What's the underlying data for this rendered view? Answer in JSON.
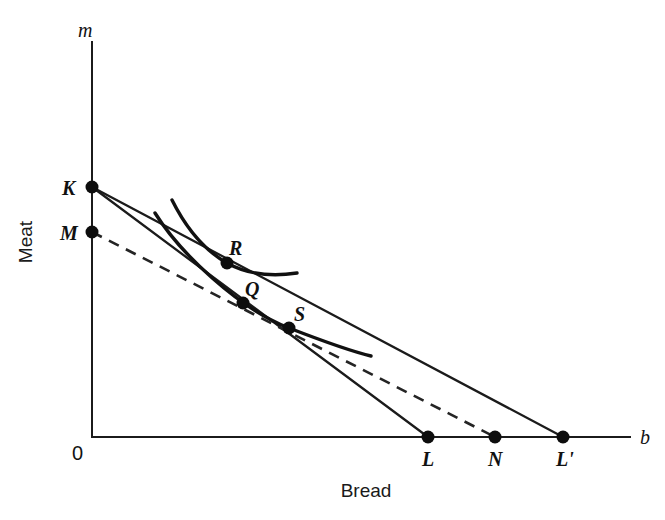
{
  "figure": {
    "background_color": "#ffffff",
    "ink_color": "#1a1a1a",
    "width": 665,
    "height": 520
  },
  "axes": {
    "y_axis_symbol": "m",
    "x_axis_symbol": "b",
    "y_axis_title": "Meat",
    "x_axis_title": "Bread",
    "origin_label": "0",
    "origin_px": {
      "x": 92,
      "y": 437
    },
    "y_axis_top_px": 42,
    "x_axis_right_px": 630
  },
  "points": {
    "K": {
      "label": "K",
      "x": 92,
      "y": 187,
      "label_x": 62,
      "label_y": 195,
      "desc": "vertical intercept of both solid budget lines"
    },
    "M": {
      "label": "M",
      "x": 92,
      "y": 232,
      "label_x": 60,
      "label_y": 240,
      "desc": "vertical intercept of dashed compensated budget line"
    },
    "R": {
      "label": "R",
      "x": 227,
      "y": 263,
      "label_x": 229,
      "label_y": 255,
      "desc": "tangency on higher indifference curve with line K-L-prime"
    },
    "Q": {
      "label": "Q",
      "x": 243,
      "y": 303,
      "label_x": 245,
      "label_y": 296,
      "desc": "tangency on lower indifference curve with dashed line M-N"
    },
    "S": {
      "label": "S",
      "x": 289,
      "y": 328,
      "label_x": 294,
      "label_y": 321,
      "desc": "tangency on lower indifference curve with line K-L"
    },
    "L": {
      "label": "L",
      "x": 428,
      "y": 437,
      "label_x": 422,
      "label_y": 466,
      "desc": "horizontal intercept of steeper solid budget line from K"
    },
    "N": {
      "label": "N",
      "x": 495,
      "y": 437,
      "label_x": 488,
      "label_y": 466,
      "desc": "horizontal intercept of dashed compensated budget line from M"
    },
    "L_prime": {
      "label": "L'",
      "x": 563,
      "y": 437,
      "label_x": 556,
      "label_y": 466,
      "desc": "horizontal intercept of flatter solid budget line from K"
    }
  },
  "lines": [
    {
      "name": "budget-line-KL",
      "from": "K",
      "to": "L",
      "style": "solid",
      "d": "M 92 187 L 428 437"
    },
    {
      "name": "budget-line-KLprime",
      "from": "K",
      "to": "L_prime",
      "style": "solid",
      "d": "M 92 187 L 563 437"
    },
    {
      "name": "compensated-budget-line-MN",
      "from": "M",
      "to": "N",
      "style": "dashed",
      "d": "M 92 232 L 495 437"
    }
  ],
  "curves": [
    {
      "name": "indifference-curve-upper",
      "through_point": "R",
      "d": "M 172 200 C 186 228, 204 250, 227 263 C 252 277, 277 276, 297 273"
    },
    {
      "name": "indifference-curve-lower",
      "through_point": "S",
      "d": "M 155 213 C 180 253, 238 308, 289 328 C 320 340, 350 351, 371 356"
    }
  ],
  "marker_radius": 6.5,
  "chart_data": {
    "type": "line",
    "xlabel": "Bread",
    "ylabel": "Meat",
    "x_axis_symbol": "b",
    "y_axis_symbol": "m",
    "grid": false,
    "legend": "none",
    "xlim": [
      0,
      1
    ],
    "ylim": [
      0,
      1
    ],
    "annotations": [
      "K",
      "M",
      "R",
      "Q",
      "S",
      "L",
      "N",
      "L'",
      "0",
      "m",
      "b",
      "Meat",
      "Bread"
    ],
    "series": [
      {
        "name": "Budget line K-L (initial, steeper)",
        "type": "line",
        "style": "solid",
        "x": [
          0,
          428
        ],
        "y": [
          187,
          437
        ],
        "intercepts": {
          "vertical": "K",
          "horizontal": "L"
        }
      },
      {
        "name": "Budget line K-L' (after price fall of bread, flatter)",
        "type": "line",
        "style": "solid",
        "x": [
          0,
          563
        ],
        "y": [
          187,
          437
        ],
        "intercepts": {
          "vertical": "K",
          "horizontal": "L'"
        }
      },
      {
        "name": "Compensated budget line M-N (dashed)",
        "type": "line",
        "style": "dashed",
        "x": [
          0,
          495
        ],
        "y": [
          232,
          437
        ],
        "intercepts": {
          "vertical": "M",
          "horizontal": "N"
        }
      },
      {
        "name": "Higher indifference curve (through R)",
        "type": "curve",
        "style": "solid",
        "tangency_point": "R"
      },
      {
        "name": "Lower indifference curve (through Q and S)",
        "type": "curve",
        "style": "solid",
        "tangency_points": [
          "Q",
          "S"
        ]
      }
    ]
  }
}
